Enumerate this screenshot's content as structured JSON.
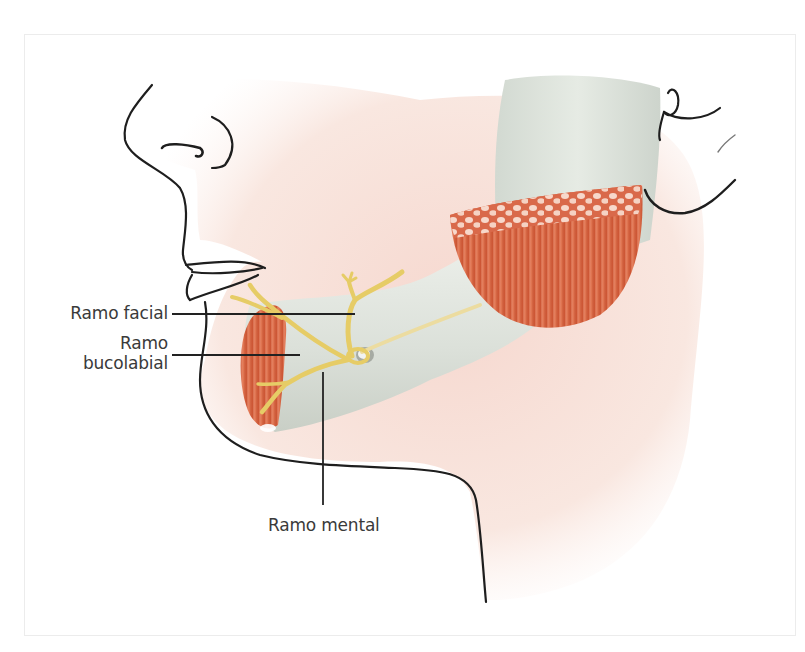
{
  "figure": {
    "labels": {
      "facial": "Ramo facial",
      "bucolabial_line1": "Ramo",
      "bucolabial_line2": "bucolabial",
      "mental": "Ramo mental"
    },
    "colors": {
      "skin": "#f9e6df",
      "skin_shadow": "#f3d3c8",
      "outline": "#1e1e1e",
      "bone": "#d7ddd6",
      "bone_highlight": "#eef1ec",
      "muscle": "#d8613f",
      "muscle_light": "#ea8a66",
      "nerve": "#e8cf6a",
      "leader_line": "#222222",
      "label_text": "#3a3a3a"
    }
  }
}
